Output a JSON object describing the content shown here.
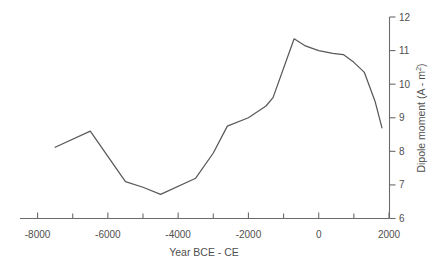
{
  "chart_data": {
    "type": "line",
    "title": "",
    "xlabel": "Year BCE - CE",
    "ylabel": "Dipole moment (A - m2)",
    "ylabel_display": "Dipole moment (A - m²)",
    "xlim": [
      -8500,
      2000
    ],
    "ylim": [
      6,
      12
    ],
    "xticks": [
      -8000,
      -6000,
      -4000,
      -2000,
      0,
      2000
    ],
    "xtick_labels": [
      "-8000",
      "-6000",
      "-4000",
      "-2000",
      "0",
      "2000"
    ],
    "xminor_ticks": [
      -7000,
      -5000,
      -3000,
      -1000,
      1000
    ],
    "yticks": [
      6,
      7,
      8,
      9,
      10,
      11,
      12
    ],
    "ytick_labels": [
      "6",
      "7",
      "8",
      "9",
      "10",
      "11",
      "12"
    ],
    "grid": false,
    "legend": false,
    "y_axis_position": "right",
    "x_axis_position": "bottom",
    "series": [
      {
        "name": "Geomagnetic dipole moment",
        "color": "#595959",
        "x": [
          -7500,
          -6500,
          -5500,
          -5000,
          -4500,
          -3500,
          -3000,
          -2600,
          -2000,
          -1500,
          -1300,
          -700,
          -400,
          0,
          400,
          700,
          1000,
          1300,
          1600,
          1800
        ],
        "y": [
          8.12,
          8.6,
          7.1,
          6.93,
          6.72,
          7.2,
          7.95,
          8.75,
          9.0,
          9.35,
          9.6,
          11.35,
          11.15,
          11.0,
          10.92,
          10.88,
          10.65,
          10.35,
          9.5,
          8.7
        ]
      }
    ]
  },
  "figure": {
    "caption_fragment": ""
  }
}
